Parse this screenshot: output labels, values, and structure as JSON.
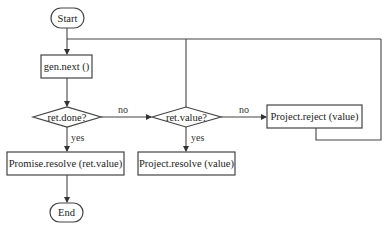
{
  "diagram": {
    "type": "flowchart",
    "nodes": {
      "start": {
        "label": "Start",
        "shape": "terminal"
      },
      "gen_next": {
        "label": "gen.next ()",
        "shape": "process"
      },
      "ret_done": {
        "label": "ret.done?",
        "shape": "decision"
      },
      "ret_value": {
        "label": "ret.value?",
        "shape": "decision"
      },
      "project_reject": {
        "label": "Project.reject (value)",
        "shape": "process"
      },
      "promise_resolve": {
        "label": "Promise.resolve (ret.value)",
        "shape": "process"
      },
      "project_resolve": {
        "label": "Project.resolve (value)",
        "shape": "process"
      },
      "end": {
        "label": "End",
        "shape": "terminal"
      }
    },
    "edges": {
      "done_no": "no",
      "done_yes": "yes",
      "value_no": "no",
      "value_yes": "yes"
    }
  }
}
